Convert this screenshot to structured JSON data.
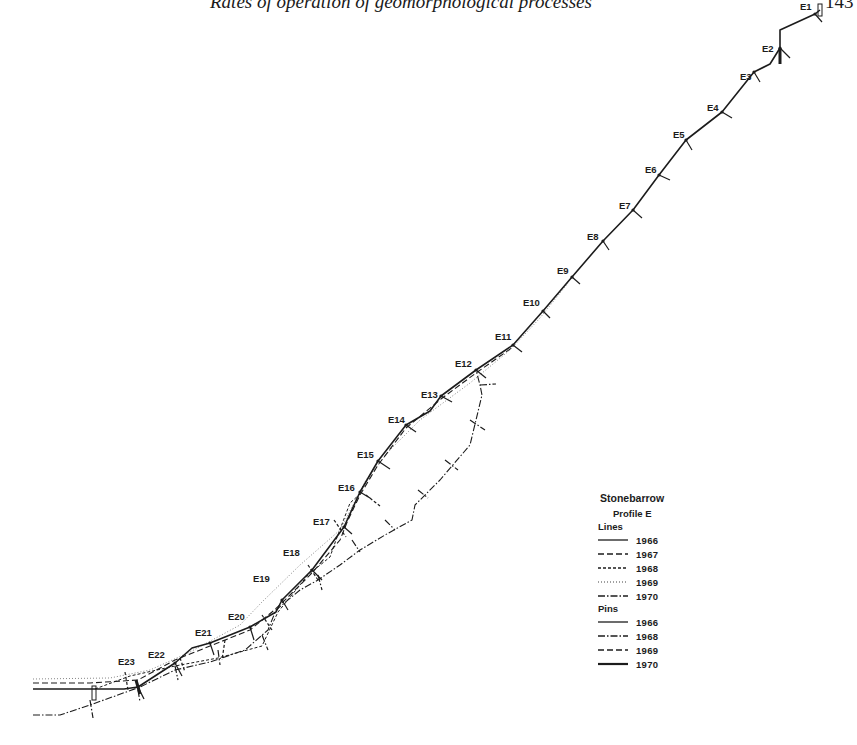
{
  "header": {
    "running_title": "Rates of operation of geomorphological processes",
    "page_number": "143"
  },
  "diagram": {
    "title": "Stonebarrow",
    "subtitle": "Profile E",
    "colors": {
      "ink": "#1c1c1c",
      "background": "#ffffff"
    },
    "stations": [
      {
        "label": "E1",
        "x": 815,
        "y": 14,
        "lx": 800,
        "ly": 10
      },
      {
        "label": "E2",
        "x": 780,
        "y": 48,
        "lx": 762,
        "ly": 52
      },
      {
        "label": "E3",
        "x": 754,
        "y": 72,
        "lx": 740,
        "ly": 80
      },
      {
        "label": "E4",
        "x": 722,
        "y": 112,
        "lx": 707,
        "ly": 111
      },
      {
        "label": "E5",
        "x": 686,
        "y": 140,
        "lx": 673,
        "ly": 138
      },
      {
        "label": "E6",
        "x": 659,
        "y": 175,
        "lx": 645,
        "ly": 173
      },
      {
        "label": "E7",
        "x": 633,
        "y": 210,
        "lx": 619,
        "ly": 209
      },
      {
        "label": "E8",
        "x": 603,
        "y": 241,
        "lx": 587,
        "ly": 240
      },
      {
        "label": "E9",
        "x": 572,
        "y": 277,
        "lx": 557,
        "ly": 274
      },
      {
        "label": "E10",
        "x": 543,
        "y": 311,
        "lx": 523,
        "ly": 306
      },
      {
        "label": "E11",
        "x": 513,
        "y": 345,
        "lx": 495,
        "ly": 340
      },
      {
        "label": "E12",
        "x": 476,
        "y": 370,
        "lx": 455,
        "ly": 367
      },
      {
        "label": "E13",
        "x": 441,
        "y": 396,
        "lx": 421,
        "ly": 398
      },
      {
        "label": "E14",
        "x": 406,
        "y": 425,
        "lx": 388,
        "ly": 423
      },
      {
        "label": "E15",
        "x": 378,
        "y": 461,
        "lx": 357,
        "ly": 458
      },
      {
        "label": "E16",
        "x": 360,
        "y": 492,
        "lx": 338,
        "ly": 491
      },
      {
        "label": "E17",
        "x": 344,
        "y": 527,
        "lx": 313,
        "ly": 525
      },
      {
        "label": "E18",
        "x": 312,
        "y": 570,
        "lx": 283,
        "ly": 556
      },
      {
        "label": "E19",
        "x": 282,
        "y": 600,
        "lx": 253,
        "ly": 582
      },
      {
        "label": "E20",
        "x": 250,
        "y": 627,
        "lx": 228,
        "ly": 620
      },
      {
        "label": "E21",
        "x": 210,
        "y": 643,
        "lx": 195,
        "ly": 636
      },
      {
        "label": "E22",
        "x": 175,
        "y": 663,
        "lx": 148,
        "ly": 658
      },
      {
        "label": "E23",
        "x": 138,
        "y": 687,
        "lx": 118,
        "ly": 665
      }
    ],
    "profile_lines": [
      {
        "year": "1966",
        "style": "solid",
        "width": 1.6,
        "points": [
          [
            33,
            689
          ],
          [
            124,
            689
          ],
          [
            138,
            687
          ],
          [
            175,
            663
          ],
          [
            192,
            648
          ],
          [
            210,
            643
          ],
          [
            250,
            627
          ],
          [
            276,
            612
          ],
          [
            282,
            600
          ],
          [
            312,
            570
          ],
          [
            344,
            527
          ],
          [
            360,
            492
          ],
          [
            378,
            461
          ],
          [
            406,
            425
          ],
          [
            430,
            411
          ],
          [
            441,
            396
          ],
          [
            476,
            370
          ],
          [
            513,
            345
          ],
          [
            543,
            311
          ],
          [
            572,
            277
          ],
          [
            603,
            241
          ],
          [
            633,
            210
          ],
          [
            659,
            175
          ],
          [
            686,
            140
          ],
          [
            722,
            112
          ],
          [
            754,
            72
          ],
          [
            770,
            64
          ],
          [
            780,
            48
          ],
          [
            780,
            30
          ],
          [
            815,
            14
          ],
          [
            820,
            10
          ]
        ]
      },
      {
        "year": "1967",
        "style": "dashed",
        "width": 1.1,
        "points": [
          [
            33,
            683
          ],
          [
            90,
            683
          ],
          [
            138,
            680
          ],
          [
            175,
            660
          ],
          [
            210,
            646
          ],
          [
            250,
            630
          ],
          [
            272,
            612
          ],
          [
            282,
            603
          ],
          [
            312,
            573
          ],
          [
            340,
            540
          ],
          [
            348,
            520
          ],
          [
            360,
            495
          ],
          [
            378,
            465
          ],
          [
            406,
            428
          ],
          [
            441,
            399
          ],
          [
            476,
            373
          ],
          [
            513,
            347
          ]
        ]
      },
      {
        "year": "1968",
        "style": "shortdash",
        "width": 1.0,
        "points": [
          [
            95,
            689
          ],
          [
            130,
            676
          ],
          [
            175,
            666
          ],
          [
            218,
            658
          ],
          [
            262,
            646
          ],
          [
            278,
            612
          ],
          [
            308,
            575
          ],
          [
            330,
            557
          ],
          [
            336,
            540
          ],
          [
            350,
            503
          ],
          [
            360,
            494
          ]
        ]
      },
      {
        "year": "1969",
        "style": "dotted",
        "width": 0.9,
        "points": [
          [
            33,
            679
          ],
          [
            110,
            678
          ],
          [
            150,
            670
          ],
          [
            190,
            652
          ],
          [
            240,
            625
          ],
          [
            262,
            602
          ],
          [
            300,
            565
          ],
          [
            340,
            530
          ],
          [
            366,
            480
          ],
          [
            390,
            450
          ],
          [
            420,
            420
          ],
          [
            470,
            383
          ],
          [
            510,
            350
          ],
          [
            540,
            318
          ],
          [
            568,
            283
          ]
        ]
      },
      {
        "year": "1970",
        "style": "dashdot",
        "width": 1.1,
        "points": [
          [
            33,
            715
          ],
          [
            60,
            715
          ],
          [
            90,
            705
          ],
          [
            140,
            687
          ],
          [
            175,
            670
          ],
          [
            210,
            662
          ],
          [
            245,
            650
          ],
          [
            268,
            630
          ],
          [
            276,
            610
          ],
          [
            300,
            590
          ],
          [
            318,
            580
          ],
          [
            340,
            565
          ],
          [
            360,
            550
          ],
          [
            385,
            535
          ],
          [
            412,
            520
          ],
          [
            415,
            505
          ],
          [
            440,
            480
          ],
          [
            470,
            445
          ],
          [
            482,
            395
          ],
          [
            480,
            385
          ],
          [
            476,
            370
          ]
        ]
      }
    ],
    "pins": [
      {
        "year": "1966",
        "style": "solid",
        "marks": [
          [
            815,
            14,
            822,
            22
          ],
          [
            780,
            48,
            790,
            58
          ],
          [
            754,
            72,
            760,
            82
          ],
          [
            722,
            112,
            732,
            118
          ],
          [
            686,
            140,
            692,
            150
          ],
          [
            659,
            175,
            670,
            180
          ],
          [
            633,
            210,
            642,
            218
          ],
          [
            603,
            241,
            609,
            250
          ],
          [
            572,
            277,
            580,
            284
          ],
          [
            543,
            311,
            550,
            318
          ],
          [
            513,
            345,
            522,
            352
          ],
          [
            476,
            370,
            486,
            378
          ],
          [
            441,
            396,
            452,
            402
          ],
          [
            406,
            425,
            416,
            432
          ],
          [
            378,
            461,
            390,
            469
          ],
          [
            360,
            492,
            370,
            498
          ],
          [
            344,
            527,
            352,
            534
          ],
          [
            312,
            570,
            322,
            580
          ],
          [
            282,
            600,
            288,
            610
          ],
          [
            250,
            627,
            254,
            640
          ],
          [
            210,
            643,
            214,
            655
          ],
          [
            175,
            663,
            182,
            676
          ],
          [
            138,
            687,
            144,
            699
          ]
        ]
      },
      {
        "year": "1968",
        "style": "dashdot",
        "marks": [
          [
            480,
            385,
            496,
            384
          ],
          [
            470,
            420,
            485,
            430
          ],
          [
            445,
            460,
            458,
            470
          ],
          [
            418,
            490,
            428,
            498
          ],
          [
            385,
            520,
            395,
            530
          ],
          [
            352,
            540,
            360,
            552
          ],
          [
            318,
            575,
            322,
            590
          ],
          [
            262,
            635,
            268,
            650
          ],
          [
            218,
            650,
            220,
            665
          ],
          [
            175,
            666,
            178,
            680
          ],
          [
            138,
            690,
            140,
            702
          ],
          [
            90,
            700,
            93,
            718
          ]
        ]
      },
      {
        "year": "1969",
        "style": "dashed",
        "marks": [
          [
            366,
            495,
            380,
            506
          ],
          [
            334,
            520,
            346,
            537
          ],
          [
            308,
            565,
            318,
            580
          ],
          [
            262,
            615,
            272,
            630
          ],
          [
            225,
            640,
            222,
            660
          ],
          [
            180,
            658,
            185,
            672
          ],
          [
            125,
            672,
            128,
            690
          ]
        ]
      },
      {
        "year": "1970",
        "style": "thick",
        "marks": [
          [
            780,
            48,
            780,
            64
          ],
          [
            136,
            680,
            140,
            694
          ]
        ]
      }
    ]
  },
  "legend": {
    "title": "Stonebarrow",
    "subtitle": "Profile E",
    "lines_heading": "Lines",
    "lines": [
      {
        "year": "1966",
        "style": "solid"
      },
      {
        "year": "1967",
        "style": "dashed"
      },
      {
        "year": "1968",
        "style": "shortdash"
      },
      {
        "year": "1969",
        "style": "dotted"
      },
      {
        "year": "1970",
        "style": "dashdot"
      }
    ],
    "pins_heading": "Pins",
    "pins": [
      {
        "year": "1966",
        "style": "solid"
      },
      {
        "year": "1968",
        "style": "dashdot"
      },
      {
        "year": "1969",
        "style": "dashed"
      },
      {
        "year": "1970",
        "style": "thick"
      }
    ]
  }
}
